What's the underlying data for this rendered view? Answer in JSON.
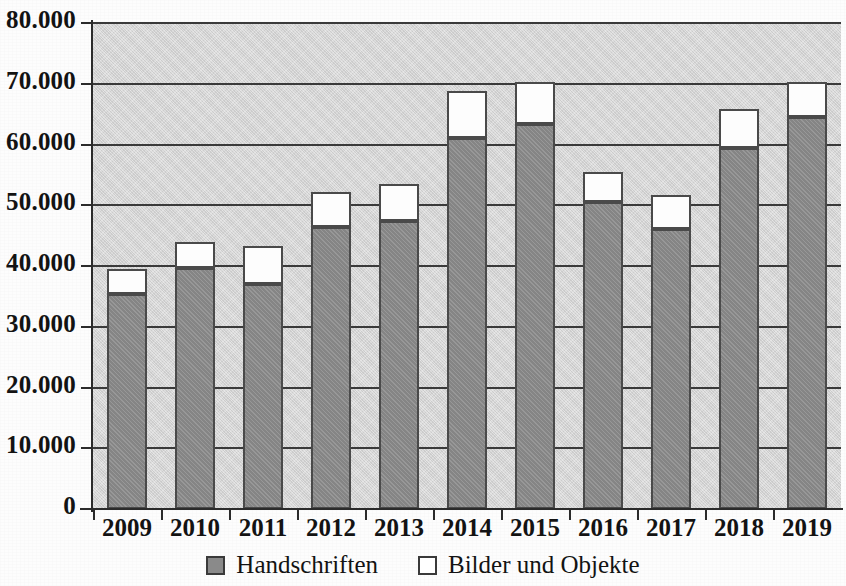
{
  "chart_data": {
    "type": "bar",
    "stacked": true,
    "title": "",
    "subtitle": "",
    "xlabel": "",
    "ylabel": "",
    "categories": [
      "2009",
      "2010",
      "2011",
      "2012",
      "2013",
      "2014",
      "2015",
      "2016",
      "2017",
      "2018",
      "2019"
    ],
    "series": [
      {
        "name": "Handschriften",
        "color": "#8c8c8c",
        "values": [
          35400,
          39700,
          37100,
          46500,
          47400,
          61000,
          63400,
          50600,
          46100,
          59500,
          64500
        ]
      },
      {
        "name": "Bilder und Objekte",
        "color": "#ffffff",
        "values": [
          3800,
          4000,
          5900,
          5400,
          5800,
          7500,
          6600,
          4600,
          5300,
          6000,
          5500
        ]
      }
    ],
    "totals": [
      39200,
      43700,
      43000,
      51900,
      53200,
      68500,
      70000,
      55200,
      51400,
      65500,
      70000
    ],
    "ylim": [
      0,
      80000
    ],
    "ytick_values": [
      0,
      10000,
      20000,
      30000,
      40000,
      50000,
      60000,
      70000,
      80000
    ],
    "ytick_labels": [
      "0",
      "10.000",
      "20.000",
      "30.000",
      "40.000",
      "50.000",
      "60.000",
      "70.000",
      "80.000"
    ],
    "grid": true,
    "grid_axis": "y",
    "legend_position": "bottom",
    "plot_background": "#d6d6d6"
  },
  "legend": {
    "items": [
      {
        "label": "Handschriften",
        "swatch": "filled-square-icon"
      },
      {
        "label": "Bilder und Objekte",
        "swatch": "empty-square-icon"
      }
    ]
  }
}
